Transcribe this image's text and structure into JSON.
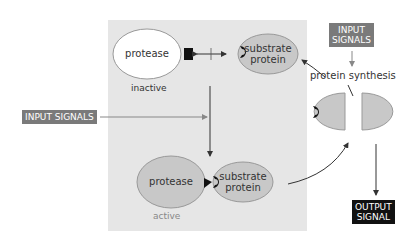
{
  "diagram": {
    "inactive_protease": {
      "label": "protease",
      "state": "inactive"
    },
    "substrate_top": {
      "label_line1": "substrate",
      "label_line2": "protein"
    },
    "active_protease": {
      "label": "protease",
      "state": "active"
    },
    "substrate_bottom": {
      "label_line1": "substrate",
      "label_line2": "protein"
    },
    "input_signals_left": "INPUT SIGNALS",
    "input_signals_top_line1": "INPUT",
    "input_signals_top_line2": "SIGNALS",
    "protein_synthesis": "protein synthesis",
    "output_signal_line1": "OUTPUT",
    "output_signal_line2": "SIGNAL",
    "colors": {
      "panel": "#e6e6e6",
      "ellipse_grey": "#c8c8c8",
      "label_box_grey": "#7a7a7a",
      "label_box_black": "#111111"
    }
  }
}
